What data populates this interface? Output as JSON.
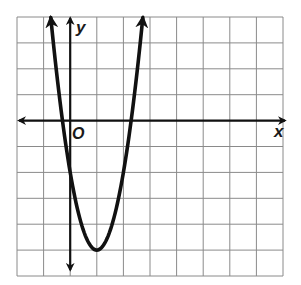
{
  "chart_data": {
    "type": "line",
    "title": "",
    "xlabel": "x",
    "ylabel": "y",
    "origin_label": "O",
    "grid": true,
    "xlim": [
      -2,
      8
    ],
    "ylim": [
      -6,
      4
    ],
    "function": "y = 3(x - 1)^2 - 5",
    "vertex": [
      1,
      -5
    ],
    "x_intercepts": [
      -0.29,
      2.29
    ],
    "series": [
      {
        "name": "parabola",
        "x": [
          -0.73,
          -0.5,
          0,
          0.5,
          1,
          1.5,
          2,
          2.5,
          2.73
        ],
        "y": [
          4.0,
          1.75,
          -2,
          -4.25,
          -5,
          -4.25,
          -2,
          1.75,
          4.0
        ]
      }
    ],
    "arrows": {
      "curve_ends": true,
      "x_axis": "both",
      "y_axis": "both"
    }
  },
  "labels": {
    "x_axis": "x",
    "y_axis": "y",
    "origin": "O"
  },
  "colors": {
    "grid": "#8a8a8a",
    "axis": "#111111",
    "curve": "#111111",
    "background": "#ffffff"
  }
}
